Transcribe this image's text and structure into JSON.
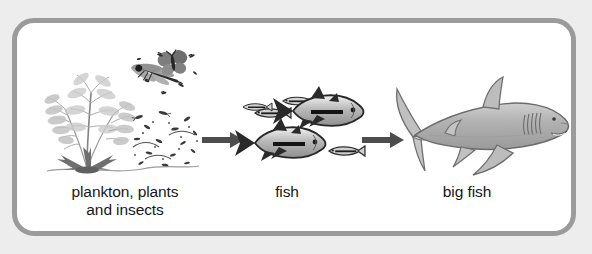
{
  "figure": {
    "background_color": "#ededed",
    "panel_color": "#ffffff",
    "border_color": "#9b9b9b",
    "text_color": "#161616"
  },
  "stages": [
    {
      "id": "producers",
      "label": "plankton, plants\nand insects",
      "illustration": "plant-insects-plankton-illustration",
      "organisms": [
        "aquatic plant",
        "dragonfly",
        "butterfly",
        "plankton",
        "insects"
      ]
    },
    {
      "id": "fish",
      "label": "fish",
      "illustration": "school-of-fish-illustration",
      "organisms": [
        "tuna-like fish",
        "small schooling fish"
      ]
    },
    {
      "id": "big-fish",
      "label": "big fish",
      "illustration": "shark-illustration",
      "organisms": [
        "shark"
      ]
    }
  ],
  "arrows": [
    {
      "id": "arrow-producers-to-fish",
      "from": "producers",
      "to": "fish",
      "direction": "right",
      "color": "#4d4d4d"
    },
    {
      "id": "arrow-fish-to-bigfish",
      "from": "fish",
      "to": "big-fish",
      "direction": "right",
      "color": "#4d4d4d"
    }
  ]
}
